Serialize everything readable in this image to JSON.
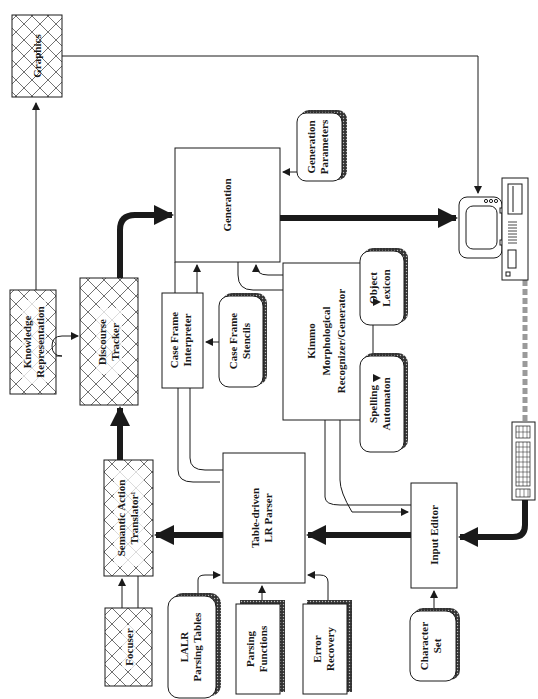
{
  "diagram": {
    "orientation": "rotated 90 degrees counter-clockwise (labels read bottom-to-top)",
    "colors": {
      "ink": "#1a1a1a",
      "background": "#ffffff",
      "link_gray": "#9a9a9a"
    },
    "nodes": {
      "graphics": {
        "lines": [
          "Graphics"
        ],
        "style": "hatched"
      },
      "knowledge_representation": {
        "lines": [
          "Knowledge",
          "Representation"
        ],
        "style": "hatched"
      },
      "discourse_tracker": {
        "lines": [
          "Discourse",
          "Tracker"
        ],
        "style": "hatched"
      },
      "semantic_action_translator": {
        "lines": [
          "Semantic Action",
          "Translator¹"
        ],
        "style": "hatched"
      },
      "focuser": {
        "lines": [
          "Focuser"
        ],
        "style": "hatched"
      },
      "generation": {
        "lines": [
          "Generation"
        ],
        "style": "plain"
      },
      "generation_parameters": {
        "lines": [
          "Generation",
          "Parameters"
        ],
        "style": "data-store"
      },
      "case_frame_interpreter": {
        "lines": [
          "Case Frame",
          "Interpreter"
        ],
        "style": "plain"
      },
      "case_frame_stencils": {
        "lines": [
          "Case Frame",
          "Stencils"
        ],
        "style": "data-store"
      },
      "kimmo": {
        "lines": [
          "Kimmo",
          "Morphological",
          "Recognizer/Generator"
        ],
        "style": "plain"
      },
      "object_lexicon": {
        "lines": [
          "Object",
          "Lexicon"
        ],
        "style": "data-store"
      },
      "spelling_automaton": {
        "lines": [
          "Spelling",
          "Automaton"
        ],
        "style": "data-store"
      },
      "lr_parser": {
        "lines": [
          "Table-driven",
          "LR Parser"
        ],
        "style": "plain"
      },
      "input_editor": {
        "lines": [
          "Input Editor"
        ],
        "style": "plain"
      },
      "lalr_tables": {
        "lines": [
          "LALR",
          "Parsing Tables"
        ],
        "style": "data-store"
      },
      "parsing_functions": {
        "lines": [
          "Parsing",
          "Functions"
        ],
        "style": "document"
      },
      "error_recovery": {
        "lines": [
          "Error",
          "Recovery"
        ],
        "style": "document"
      },
      "character_set": {
        "lines": [
          "Character",
          "Set"
        ],
        "style": "data-store"
      }
    },
    "devices": [
      "monitor",
      "computer-unit",
      "keyboard"
    ],
    "edges": [
      {
        "from": "knowledge_representation",
        "to": "graphics",
        "weight": "thin"
      },
      {
        "from": "graphics",
        "to": "monitor",
        "weight": "thin"
      },
      {
        "from": "knowledge_representation",
        "to": "discourse_tracker",
        "weight": "thin"
      },
      {
        "from": "discourse_tracker",
        "to": "generation",
        "weight": "thick"
      },
      {
        "from": "generation",
        "to": "monitor",
        "weight": "thick"
      },
      {
        "from": "generation_parameters",
        "to": "generation",
        "weight": "thin"
      },
      {
        "from": "case_frame_interpreter",
        "to": "generation",
        "weight": "thin"
      },
      {
        "from": "kimmo",
        "to": "generation",
        "weight": "thin"
      },
      {
        "from": "case_frame_stencils",
        "to": "case_frame_interpreter",
        "weight": "thin"
      },
      {
        "from": "object_lexicon",
        "to": "kimmo",
        "weight": "thin"
      },
      {
        "from": "spelling_automaton",
        "to": "kimmo",
        "weight": "thin"
      },
      {
        "from": "semantic_action_translator",
        "to": "discourse_tracker",
        "weight": "thick"
      },
      {
        "from": "lr_parser",
        "to": "semantic_action_translator",
        "weight": "thick"
      },
      {
        "from": "focuser",
        "to": "semantic_action_translator",
        "weight": "thin"
      },
      {
        "from": "input_editor",
        "to": "lr_parser",
        "weight": "thick"
      },
      {
        "from": "kimmo",
        "to": "input_editor",
        "weight": "thin"
      },
      {
        "from": "case_frame_interpreter",
        "to": "lr_parser",
        "weight": "thin"
      },
      {
        "from": "lalr_tables",
        "to": "lr_parser",
        "weight": "thin"
      },
      {
        "from": "parsing_functions",
        "to": "lr_parser",
        "weight": "thin"
      },
      {
        "from": "error_recovery",
        "to": "lr_parser",
        "weight": "thin"
      },
      {
        "from": "character_set",
        "to": "input_editor",
        "weight": "thin"
      },
      {
        "from": "keyboard",
        "to": "input_editor",
        "weight": "thick"
      },
      {
        "from": "keyboard",
        "to": "computer-unit",
        "weight": "gray-link"
      }
    ]
  }
}
